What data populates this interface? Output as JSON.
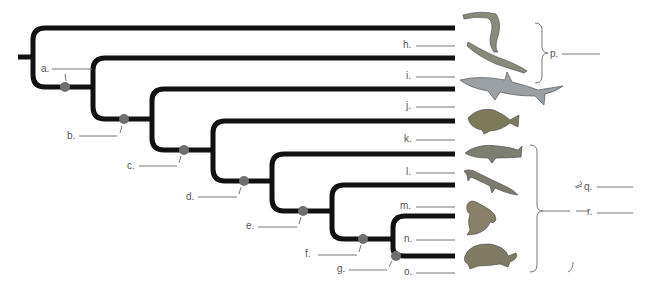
{
  "diagram": {
    "type": "cladogram",
    "node_labels": [
      {
        "id": "a",
        "text": "a."
      },
      {
        "id": "b",
        "text": "b."
      },
      {
        "id": "c",
        "text": "c."
      },
      {
        "id": "d",
        "text": "d."
      },
      {
        "id": "e",
        "text": "e."
      },
      {
        "id": "f",
        "text": "f."
      },
      {
        "id": "g",
        "text": "g."
      }
    ],
    "taxon_labels": [
      {
        "id": "h",
        "text": "h.",
        "animal": "hagfish"
      },
      {
        "id": "i",
        "text": "i.",
        "animal": "lamprey"
      },
      {
        "id": "j",
        "text": "j.",
        "animal": "shark"
      },
      {
        "id": "k",
        "text": "k.",
        "animal": "perch"
      },
      {
        "id": "l",
        "text": "l.",
        "animal": "lungfish"
      },
      {
        "id": "m",
        "text": "m.",
        "animal": "salamander"
      },
      {
        "id": "n",
        "text": "n.",
        "animal": "frog"
      },
      {
        "id": "o",
        "text": "o.",
        "animal": "turtle"
      }
    ],
    "group_labels": [
      {
        "id": "p",
        "text": "p."
      },
      {
        "id": "q",
        "text": "q."
      },
      {
        "id": "r",
        "text": "r."
      }
    ],
    "colors": {
      "branch": "#111111",
      "node_dot": "#6e6e6e",
      "label": "#555555",
      "blank_line": "#777777"
    }
  }
}
